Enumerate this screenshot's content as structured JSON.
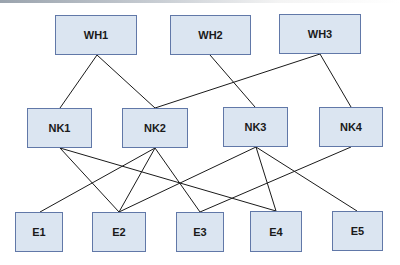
{
  "diagram": {
    "type": "network-hierarchy",
    "colors": {
      "node_fill": "#dbe5f1",
      "node_border": "#6178a8",
      "edge": "#1a1a1a",
      "text": "#1a1a1a"
    },
    "nodes": [
      {
        "id": "WH1",
        "label": "WH1",
        "tier": "warehouse",
        "x": 55,
        "y": 15,
        "w": 82,
        "h": 40
      },
      {
        "id": "WH2",
        "label": "WH2",
        "tier": "warehouse",
        "x": 170,
        "y": 15,
        "w": 81,
        "h": 40
      },
      {
        "id": "WH3",
        "label": "WH3",
        "tier": "warehouse",
        "x": 279,
        "y": 14,
        "w": 82,
        "h": 40
      },
      {
        "id": "NK1",
        "label": "NK1",
        "tier": "node",
        "x": 27,
        "y": 108,
        "w": 65,
        "h": 40
      },
      {
        "id": "NK2",
        "label": "NK2",
        "tier": "node",
        "x": 122,
        "y": 108,
        "w": 66,
        "h": 40
      },
      {
        "id": "NK3",
        "label": "NK3",
        "tier": "node",
        "x": 223,
        "y": 107,
        "w": 65,
        "h": 40
      },
      {
        "id": "NK4",
        "label": "NK4",
        "tier": "node",
        "x": 319,
        "y": 107,
        "w": 64,
        "h": 40
      },
      {
        "id": "E1",
        "label": "E1",
        "tier": "endpoint",
        "x": 15,
        "y": 212,
        "w": 48,
        "h": 40
      },
      {
        "id": "E2",
        "label": "E2",
        "tier": "endpoint",
        "x": 92,
        "y": 212,
        "w": 54,
        "h": 40
      },
      {
        "id": "E3",
        "label": "E3",
        "tier": "endpoint",
        "x": 176,
        "y": 212,
        "w": 48,
        "h": 40
      },
      {
        "id": "E4",
        "label": "E4",
        "tier": "endpoint",
        "x": 250,
        "y": 211,
        "w": 52,
        "h": 41
      },
      {
        "id": "E5",
        "label": "E5",
        "tier": "endpoint",
        "x": 332,
        "y": 211,
        "w": 51,
        "h": 40
      }
    ],
    "edges": [
      {
        "from": "WH1",
        "to": "NK1",
        "x1": 97,
        "y1": 55,
        "x2": 60,
        "y2": 108
      },
      {
        "from": "WH1",
        "to": "NK2",
        "x1": 97,
        "y1": 55,
        "x2": 155,
        "y2": 108
      },
      {
        "from": "WH2",
        "to": "NK3",
        "x1": 210,
        "y1": 55,
        "x2": 255,
        "y2": 107
      },
      {
        "from": "WH3",
        "to": "NK2",
        "x1": 320,
        "y1": 54,
        "x2": 155,
        "y2": 108
      },
      {
        "from": "WH3",
        "to": "NK4",
        "x1": 320,
        "y1": 54,
        "x2": 351,
        "y2": 107
      },
      {
        "from": "NK1",
        "to": "E2",
        "x1": 60,
        "y1": 148,
        "x2": 119,
        "y2": 212
      },
      {
        "from": "NK1",
        "to": "E4",
        "x1": 60,
        "y1": 148,
        "x2": 276,
        "y2": 211
      },
      {
        "from": "NK2",
        "to": "E1",
        "x1": 155,
        "y1": 148,
        "x2": 40,
        "y2": 212
      },
      {
        "from": "NK2",
        "to": "E2",
        "x1": 155,
        "y1": 148,
        "x2": 119,
        "y2": 212
      },
      {
        "from": "NK2",
        "to": "E3",
        "x1": 155,
        "y1": 148,
        "x2": 200,
        "y2": 212
      },
      {
        "from": "NK3",
        "to": "E2",
        "x1": 256,
        "y1": 147,
        "x2": 119,
        "y2": 212
      },
      {
        "from": "NK3",
        "to": "E4",
        "x1": 256,
        "y1": 147,
        "x2": 276,
        "y2": 211
      },
      {
        "from": "NK3",
        "to": "E5",
        "x1": 256,
        "y1": 147,
        "x2": 357,
        "y2": 211
      },
      {
        "from": "NK4",
        "to": "E3",
        "x1": 351,
        "y1": 147,
        "x2": 200,
        "y2": 212
      }
    ]
  }
}
